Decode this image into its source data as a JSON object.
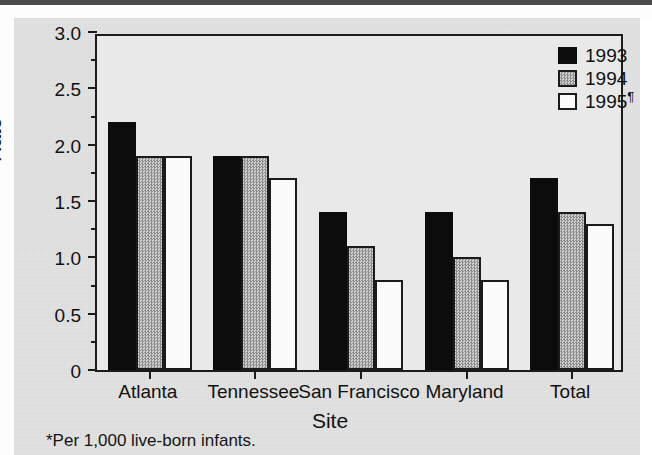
{
  "figure": {
    "y_axis_title": "Rate",
    "x_axis_title": "Site",
    "footnote": "*Per 1,000 live-born infants."
  },
  "legend": {
    "items": [
      {
        "label": "1993",
        "sup": "",
        "key": "s1993",
        "color": "#0c0c0c",
        "swatch_name": "legend-swatch-1993"
      },
      {
        "label": "1994",
        "sup": "",
        "key": "s1994",
        "color": "#b3b3b3",
        "swatch_name": "legend-swatch-1994"
      },
      {
        "label": "1995",
        "sup": "¶",
        "key": "s1995",
        "color": "#fbfbfb",
        "swatch_name": "legend-swatch-1995"
      }
    ]
  },
  "chart_data": {
    "type": "bar",
    "title": "",
    "xlabel": "Site",
    "ylabel": "Rate",
    "ylim": [
      0,
      3.0
    ],
    "yticks": [
      "0",
      "0.5",
      "1.0",
      "1.5",
      "2.0",
      "2.5",
      "3.0"
    ],
    "ytick_values": [
      0,
      0.5,
      1.0,
      1.5,
      2.0,
      2.5,
      3.0
    ],
    "yminor_values": [
      0.25,
      0.75,
      1.25,
      1.75,
      2.25,
      2.75
    ],
    "grid": false,
    "legend_position": "top-right",
    "categories": [
      "Atlanta",
      "Tennessee",
      "San Francisco",
      "Maryland",
      "Total"
    ],
    "series": [
      {
        "name": "1993",
        "key": "s1993",
        "values": [
          2.2,
          1.9,
          1.4,
          1.4,
          1.7
        ]
      },
      {
        "name": "1994",
        "key": "s1994",
        "values": [
          1.9,
          1.9,
          1.1,
          1.0,
          1.4
        ]
      },
      {
        "name": "1995",
        "key": "s1995",
        "values": [
          1.9,
          1.7,
          0.8,
          0.8,
          1.3
        ]
      }
    ],
    "annotations": [
      "*Per 1,000 live-born infants."
    ]
  }
}
